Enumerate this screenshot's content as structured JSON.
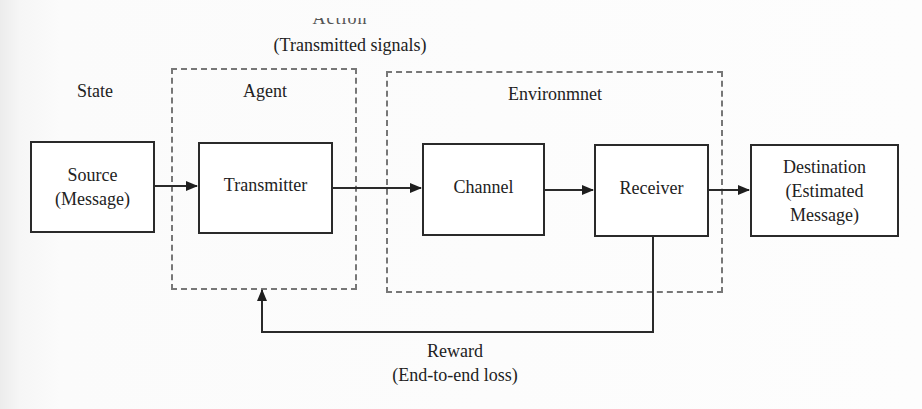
{
  "diagram": {
    "top_label_clipped": "Action",
    "top_label": "(Transmitted signals)",
    "state_label": "State",
    "agent_label": "Agent",
    "environment_label": "Environmnet",
    "blocks": {
      "source": {
        "line1": "Source",
        "line2": "(Message)"
      },
      "transmitter": {
        "line1": "Transmitter"
      },
      "channel": {
        "line1": "Channel"
      },
      "receiver": {
        "line1": "Receiver"
      },
      "destination": {
        "line1": "Destination",
        "line2": "(Estimated",
        "line3": "Message)"
      }
    },
    "feedback_label": "Reward",
    "feedback_sublabel": "(End-to-end loss)",
    "colors": {
      "line": "#2a2a2a",
      "dashed": "#777777"
    }
  }
}
